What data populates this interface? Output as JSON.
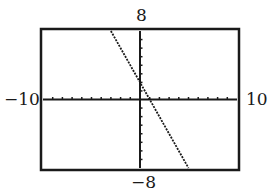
{
  "chart_data": {
    "type": "line",
    "title": "",
    "xlabel": "",
    "ylabel": "",
    "xlim": [
      -10,
      10
    ],
    "ylim": [
      -8,
      8
    ],
    "x_tick_step": 1,
    "y_tick_step": 1,
    "grid": false,
    "window_labels": {
      "xmin": "−10",
      "xmax": "10",
      "ymin": "−8",
      "ymax": "8"
    },
    "series": [
      {
        "name": "y = -2x + 2",
        "slope": -2,
        "intercept": 2,
        "x": [
          -3,
          5
        ],
        "y": [
          8,
          -8
        ],
        "style": "dotted"
      }
    ]
  },
  "colors": {
    "axis": "#1a1a1a",
    "line": "#1a1a1a",
    "frame": "#1a1a1a",
    "background": "#ffffff"
  }
}
